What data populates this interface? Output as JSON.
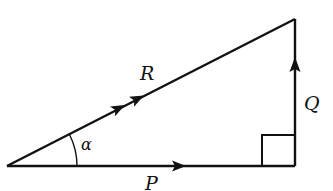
{
  "diagram": {
    "type": "vector-triangle",
    "labels": {
      "hypotenuse": "R",
      "base": "P",
      "vertical": "Q",
      "angle": "α"
    },
    "stroke_color": "#111111",
    "background": "#ffffff",
    "right_angle_marker": true,
    "arrows": {
      "R": "double",
      "P": "single",
      "Q": "single"
    }
  }
}
